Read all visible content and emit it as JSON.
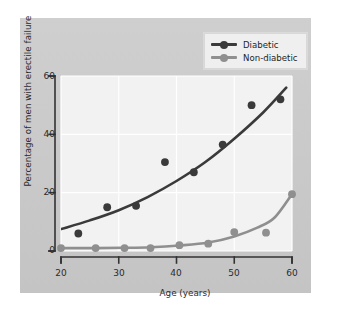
{
  "chart_data": {
    "type": "scatter",
    "title": "",
    "xlabel": "Age (years)",
    "ylabel": "Percentage of men with erectile failure",
    "xlim": [
      20,
      60
    ],
    "ylim": [
      0,
      60
    ],
    "xticks": [
      20,
      30,
      40,
      50,
      60
    ],
    "yticks": [
      0,
      20,
      40,
      60
    ],
    "grid": true,
    "legend_position": "top-right",
    "series": [
      {
        "name": "Diabetic",
        "color": "#3a3a3a",
        "marker": "filled-circle",
        "fit": "smooth-curve",
        "points": [
          {
            "x": 23.0,
            "y": 6.0
          },
          {
            "x": 28.0,
            "y": 15.0
          },
          {
            "x": 33.0,
            "y": 15.5
          },
          {
            "x": 38.0,
            "y": 30.5
          },
          {
            "x": 43.0,
            "y": 27.0
          },
          {
            "x": 48.0,
            "y": 36.5
          },
          {
            "x": 53.0,
            "y": 50.0
          },
          {
            "x": 58.0,
            "y": 52.0
          }
        ],
        "curve": [
          {
            "x": 20.0,
            "y": 7.5
          },
          {
            "x": 25.0,
            "y": 10.5
          },
          {
            "x": 30.0,
            "y": 14.0
          },
          {
            "x": 35.0,
            "y": 18.5
          },
          {
            "x": 40.0,
            "y": 24.0
          },
          {
            "x": 45.0,
            "y": 30.5
          },
          {
            "x": 50.0,
            "y": 38.5
          },
          {
            "x": 55.0,
            "y": 47.5
          },
          {
            "x": 59.0,
            "y": 56.0
          }
        ]
      },
      {
        "name": "Non-diabetic",
        "color": "#8f8f8f",
        "marker": "filled-circle",
        "fit": "smooth-curve",
        "points": [
          {
            "x": 20.0,
            "y": 1.0
          },
          {
            "x": 26.0,
            "y": 1.0
          },
          {
            "x": 31.0,
            "y": 1.0
          },
          {
            "x": 35.5,
            "y": 1.0
          },
          {
            "x": 40.5,
            "y": 2.0
          },
          {
            "x": 45.5,
            "y": 2.5
          },
          {
            "x": 50.0,
            "y": 6.5
          },
          {
            "x": 55.5,
            "y": 6.3
          },
          {
            "x": 60.0,
            "y": 19.5
          }
        ],
        "curve": [
          {
            "x": 20.0,
            "y": 1.0
          },
          {
            "x": 26.0,
            "y": 1.0
          },
          {
            "x": 31.0,
            "y": 1.1
          },
          {
            "x": 35.5,
            "y": 1.3
          },
          {
            "x": 40.5,
            "y": 1.9
          },
          {
            "x": 45.5,
            "y": 2.9
          },
          {
            "x": 50.0,
            "y": 5.0
          },
          {
            "x": 54.0,
            "y": 8.0
          },
          {
            "x": 57.0,
            "y": 11.5
          },
          {
            "x": 60.0,
            "y": 19.5
          }
        ]
      }
    ]
  },
  "legend": {
    "items": [
      {
        "label": "Diabetic",
        "color": "#3a3a3a"
      },
      {
        "label": "Non-diabetic",
        "color": "#8f8f8f"
      }
    ]
  },
  "axes": {
    "x_title": "Age (years)",
    "y_title": "Percentage of men with erectile failure",
    "x_tick_labels": [
      "20",
      "30",
      "40",
      "50",
      "60"
    ],
    "y_tick_labels": [
      "0",
      "20",
      "40",
      "60"
    ]
  },
  "colors": {
    "panel": "#c9c9c9",
    "plot_background": "#f2f2f2",
    "gridline": "#ffffff",
    "axis": "#333333",
    "diabetic": "#3a3a3a",
    "non_diabetic": "#8f8f8f"
  }
}
